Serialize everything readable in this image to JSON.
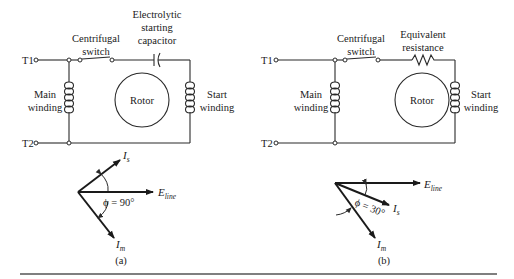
{
  "figure": {
    "panel_a": {
      "caption": "(a)",
      "terminals": {
        "t1": "T1",
        "t2": "T2"
      },
      "labels": {
        "centrifugal_switch": [
          "Centrifugal",
          "switch"
        ],
        "series_element": [
          "Electrolytic",
          "starting",
          "capacitor"
        ],
        "main_winding": [
          "Main",
          "winding"
        ],
        "start_winding": [
          "Start",
          "winding"
        ],
        "rotor": "Rotor"
      },
      "series_element_type": "capacitor",
      "phasor": {
        "reference": {
          "symbol": "E",
          "subscript": "line"
        },
        "start_current": {
          "symbol": "I",
          "subscript": "s"
        },
        "main_current": {
          "symbol": "I",
          "subscript": "m"
        },
        "angle_label": "ϕ = 90°",
        "phase_angle_deg": 90
      }
    },
    "panel_b": {
      "caption": "(b)",
      "terminals": {
        "t1": "T1",
        "t2": "T2"
      },
      "labels": {
        "centrifugal_switch": [
          "Centrifugal",
          "switch"
        ],
        "series_element": [
          "Equivalent",
          "resistance"
        ],
        "main_winding": [
          "Main",
          "winding"
        ],
        "start_winding": [
          "Start",
          "winding"
        ],
        "rotor": "Rotor"
      },
      "series_element_type": "resistor",
      "phasor": {
        "reference": {
          "symbol": "E",
          "subscript": "line"
        },
        "start_current": {
          "symbol": "I",
          "subscript": "s"
        },
        "main_current": {
          "symbol": "I",
          "subscript": "m"
        },
        "angle_label": "ϕ = 30°",
        "phase_angle_deg": 30
      }
    }
  }
}
